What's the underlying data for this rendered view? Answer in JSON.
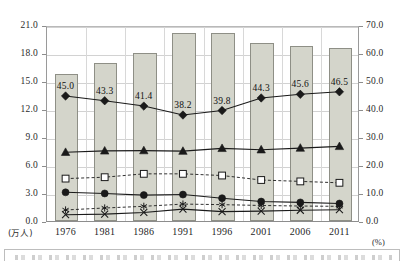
{
  "chart_data": {
    "type": "bar",
    "title": "",
    "subtitle": "",
    "categories": [
      "1976",
      "1981",
      "1986",
      "1991",
      "1996",
      "2001",
      "2006",
      "2011"
    ],
    "xlabel": "",
    "ylabel": "(万人)",
    "y2label": "(%)",
    "ylim": [
      0.0,
      21.0
    ],
    "y2lim": [
      0.0,
      70.0
    ],
    "yticks": [
      "0.0",
      "3.0",
      "6.0",
      "9.0",
      "12.0",
      "15.0",
      "18.0",
      "21.0"
    ],
    "y2ticks": [
      "0.0",
      "10.0",
      "20.0",
      "30.0",
      "40.0",
      "50.0",
      "60.0",
      "70.0"
    ],
    "grid": true,
    "legend": "",
    "legend_position": "bottom",
    "series": [
      {
        "name": "bars",
        "type": "bar",
        "axis": "left",
        "marker": "none",
        "line": "none",
        "fill": "#d4d5cb",
        "edge": "#8e8f86",
        "values": [
          15.8,
          16.9,
          18.0,
          20.1,
          20.1,
          19.1,
          18.7,
          18.5
        ],
        "labels": [
          "",
          "",
          "",
          "",
          "",
          "",
          "",
          ""
        ]
      },
      {
        "name": "diamond-series",
        "type": "line",
        "axis": "right",
        "marker": "diamond",
        "line": "solid",
        "color": "#1a1a1a",
        "values": [
          45.0,
          43.3,
          41.4,
          38.2,
          39.8,
          44.3,
          45.6,
          46.5
        ],
        "labels": [
          "45.0",
          "43.3",
          "41.4",
          "38.2",
          "39.8",
          "44.3",
          "45.6",
          "46.5"
        ]
      },
      {
        "name": "triangle-series",
        "type": "line",
        "axis": "right",
        "marker": "triangle",
        "line": "solid",
        "color": "#1a1a1a",
        "values": [
          24.9,
          25.4,
          25.5,
          25.3,
          26.3,
          25.8,
          26.4,
          27.0
        ],
        "labels": [
          "",
          "",
          "",
          "",
          "",
          "",
          "",
          ""
        ]
      },
      {
        "name": "open-square-series",
        "type": "line",
        "axis": "right",
        "marker": "square-open",
        "line": "dashed",
        "color": "#1a1a1a",
        "values": [
          15.5,
          16.0,
          17.2,
          17.2,
          16.6,
          15.0,
          14.5,
          14.0
        ],
        "labels": [
          "",
          "",
          "",
          "",
          "",
          "",
          "",
          ""
        ]
      },
      {
        "name": "filled-circle-series",
        "type": "line",
        "axis": "right",
        "marker": "circle",
        "line": "solid",
        "color": "#1a1a1a",
        "values": [
          10.6,
          10.2,
          9.6,
          9.8,
          8.5,
          7.3,
          7.0,
          6.6
        ],
        "labels": [
          "",
          "",
          "",
          "",
          "",
          "",
          "",
          ""
        ]
      },
      {
        "name": "asterisk-series",
        "type": "line",
        "axis": "right",
        "marker": "asterisk",
        "line": "dashed",
        "color": "#1a1a1a",
        "values": [
          4.3,
          5.0,
          5.6,
          6.4,
          6.2,
          5.9,
          5.7,
          5.6
        ],
        "labels": [
          "",
          "",
          "",
          "",
          "",
          "",
          "",
          ""
        ]
      },
      {
        "name": "cross-series",
        "type": "line",
        "axis": "right",
        "marker": "cross",
        "line": "solid",
        "color": "#1a1a1a",
        "values": [
          2.6,
          2.8,
          3.4,
          4.6,
          3.7,
          3.9,
          4.2,
          4.4
        ],
        "labels": [
          "",
          "",
          "",
          "",
          "",
          "",
          "",
          ""
        ]
      }
    ]
  }
}
